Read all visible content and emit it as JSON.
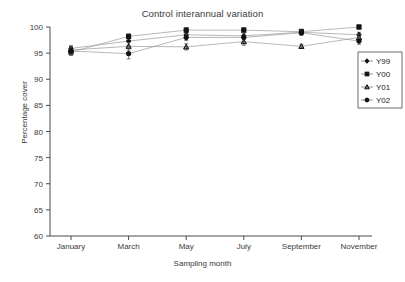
{
  "chart_data": {
    "type": "line",
    "title": "Control interannual variation",
    "xlabel": "Sampling month",
    "ylabel": "Percentage cover",
    "categories": [
      "January",
      "March",
      "May",
      "July",
      "September",
      "November"
    ],
    "xtick_labels": [
      "January",
      "March",
      "May",
      "July",
      "September",
      "November"
    ],
    "ytick_labels": [
      "60",
      "65",
      "70",
      "75",
      "80",
      "85",
      "90",
      "95",
      "100"
    ],
    "yticks": [
      60,
      65,
      70,
      75,
      80,
      85,
      90,
      95,
      100
    ],
    "ylim": [
      60,
      100
    ],
    "grid": false,
    "legend_position": "right",
    "series": [
      {
        "name": "Y99",
        "marker": "diamond",
        "values": [
          95.9,
          97.3,
          98.5,
          98.3,
          99.0,
          98.5
        ],
        "errors": [
          0.5,
          0.8,
          0.5,
          0.6,
          0.5,
          0.5
        ]
      },
      {
        "name": "Y00",
        "marker": "square",
        "values": [
          95.2,
          98.2,
          99.4,
          99.4,
          99.1,
          100.0
        ],
        "errors": [
          0.6,
          0.5,
          0.5,
          0.5,
          0.5,
          0.4
        ]
      },
      {
        "name": "Y01",
        "marker": "triangle",
        "values": [
          95.6,
          96.3,
          96.2,
          97.2,
          96.3,
          98.0
        ],
        "errors": [
          0.7,
          0.7,
          0.6,
          0.7,
          0.4,
          0.6
        ]
      },
      {
        "name": "Y02",
        "marker": "circle",
        "values": [
          95.4,
          94.9,
          98.0,
          98.0,
          98.9,
          97.3
        ],
        "errors": [
          0.8,
          1.0,
          0.6,
          0.9,
          0.5,
          0.6
        ]
      }
    ]
  },
  "legend": {
    "entries": [
      "Y99",
      "Y00",
      "Y01",
      "Y02"
    ]
  },
  "colors": {
    "line": "#9a9a9a",
    "marker": "#111111",
    "axis": "#4a4a4a",
    "text": "#3a3a3a",
    "background": "#ffffff"
  }
}
